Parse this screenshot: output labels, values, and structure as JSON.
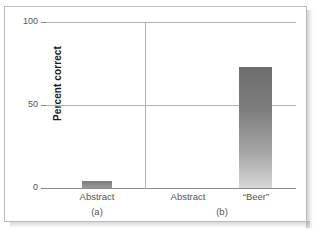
{
  "chart_data": {
    "type": "bar",
    "title": "",
    "subtitle": "",
    "xlabel": "",
    "ylabel": "Percent correct",
    "ylim": [
      0,
      100
    ],
    "yticks": [
      "0",
      "50",
      "100"
    ],
    "grid": true,
    "legend": null,
    "panels": [
      {
        "panel_label": "(a)",
        "categories": [
          "Abstract"
        ],
        "values": [
          4
        ]
      },
      {
        "panel_label": "(b)",
        "categories": [
          "Abstract",
          "“Beer”"
        ],
        "values": [
          0,
          73
        ]
      }
    ],
    "colors": {
      "bar_top": "#6e6e6e",
      "bar_bottom": "#d8d8d8",
      "gridline": "#b0b0b0",
      "axis": "#8a8a8a",
      "frame": "#b9b9b9",
      "text": "#555555",
      "axis_title_text": "#1a1a1a"
    }
  },
  "axis": {
    "y_title": "Percent correct",
    "y_tick_100": "100",
    "y_tick_50": "50",
    "y_tick_0": "0"
  },
  "panel_a": {
    "category_1": "Abstract",
    "label": "(a)"
  },
  "panel_b": {
    "category_1": "Abstract",
    "category_2": "“Beer”",
    "label": "(b)"
  }
}
